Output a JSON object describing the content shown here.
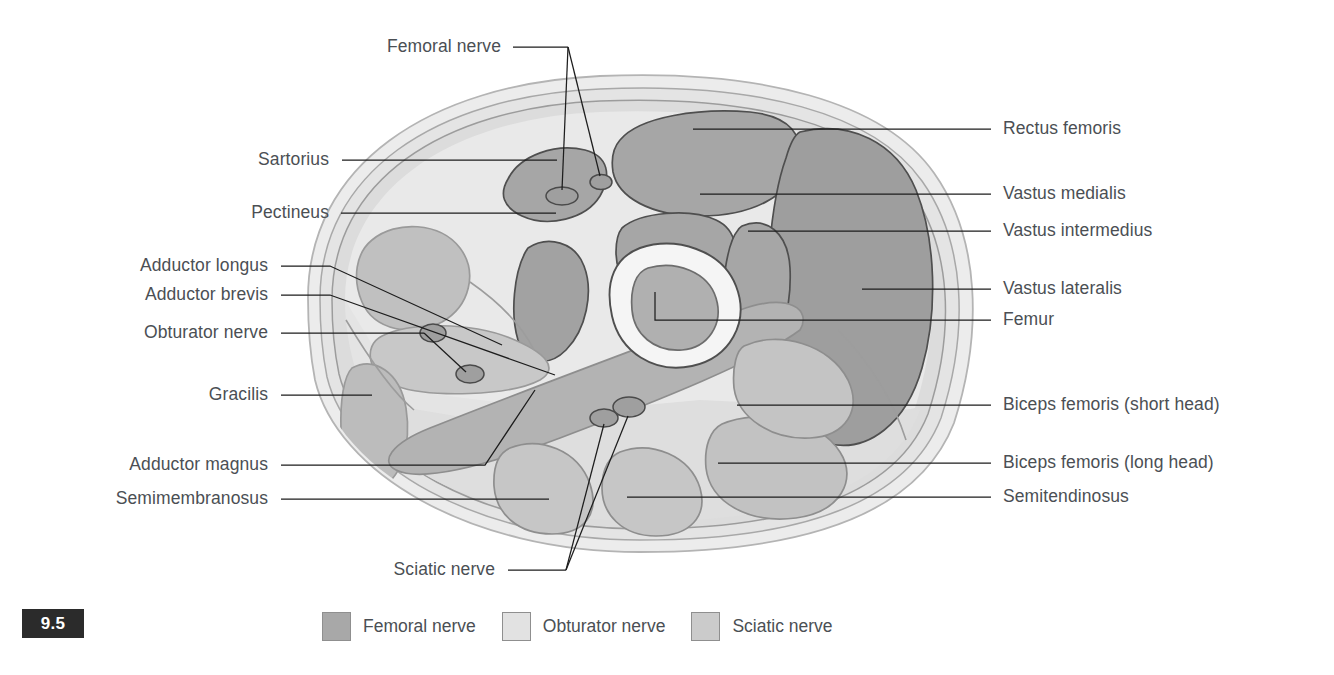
{
  "figure": {
    "number": "9.5"
  },
  "colors": {
    "femoral_nerve_territory": "#a8a8a8",
    "obturator_nerve_territory": "#d8d8d8",
    "sciatic_nerve_territory": "#c4c4c4",
    "skin_outer": "#ededed",
    "fat_layer": "#e3e3e3",
    "fascia_layer": "#d3d3d3",
    "bone_cortex": "#f4f4f4",
    "bone_marrow": "#b0b0b0",
    "nerve_dot": "#a0a0a0",
    "label_text": "#4b4f54",
    "leader_line": "#1d1d1d",
    "badge_background": "#2b2b2b",
    "badge_text": "#ffffff"
  },
  "labels_left": [
    {
      "id": "femoral-nerve",
      "text": "Femoral nerve",
      "x": 501,
      "y": 52
    },
    {
      "id": "sartorius",
      "text": "Sartorius",
      "x": 329,
      "y": 165
    },
    {
      "id": "pectineus",
      "text": "Pectineus",
      "x": 329,
      "y": 218
    },
    {
      "id": "adductor-longus",
      "text": "Adductor longus",
      "x": 268,
      "y": 271
    },
    {
      "id": "adductor-brevis",
      "text": "Adductor brevis",
      "x": 268,
      "y": 300
    },
    {
      "id": "obturator-nerve",
      "text": "Obturator nerve",
      "x": 268,
      "y": 338
    },
    {
      "id": "gracilis",
      "text": "Gracilis",
      "x": 268,
      "y": 400
    },
    {
      "id": "adductor-magnus",
      "text": "Adductor magnus",
      "x": 268,
      "y": 470
    },
    {
      "id": "semimembranosus",
      "text": "Semimembranosus",
      "x": 268,
      "y": 504
    },
    {
      "id": "sciatic-nerve",
      "text": "Sciatic nerve",
      "x": 495,
      "y": 575
    }
  ],
  "labels_right": [
    {
      "id": "rectus-femoris",
      "text": "Rectus femoris",
      "x": 1003,
      "y": 134
    },
    {
      "id": "vastus-medialis",
      "text": "Vastus medialis",
      "x": 1003,
      "y": 199
    },
    {
      "id": "vastus-intermedius",
      "text": "Vastus intermedius",
      "x": 1003,
      "y": 236
    },
    {
      "id": "vastus-lateralis",
      "text": "Vastus lateralis",
      "x": 1003,
      "y": 294
    },
    {
      "id": "femur",
      "text": "Femur",
      "x": 1003,
      "y": 325
    },
    {
      "id": "biceps-femoris-short",
      "text": "Biceps femoris (short head)",
      "x": 1003,
      "y": 410
    },
    {
      "id": "biceps-femoris-long",
      "text": "Biceps femoris (long head)",
      "x": 1003,
      "y": 468
    },
    {
      "id": "semitendinosus",
      "text": "Semitendinosus",
      "x": 1003,
      "y": 502
    }
  ],
  "legend": {
    "items": [
      {
        "id": "femoral-nerve",
        "label": "Femoral nerve",
        "color": "#a8a8a8"
      },
      {
        "id": "obturator-nerve",
        "label": "Obturator nerve",
        "color": "#e0e0e0"
      },
      {
        "id": "sciatic-nerve",
        "label": "Sciatic nerve",
        "color": "#c9c9c9"
      }
    ]
  }
}
